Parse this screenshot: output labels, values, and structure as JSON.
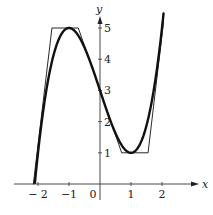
{
  "chart_data": {
    "type": "line",
    "title": "",
    "xlabel": "x",
    "ylabel": "y",
    "xlim": [
      -2.8,
      2.8
    ],
    "ylim": [
      -0.5,
      5.6
    ],
    "x_ticks": [
      -2,
      -1,
      0,
      1,
      2
    ],
    "x_tick_labels": [
      "− 2",
      "−1",
      "0",
      "1",
      "2"
    ],
    "y_ticks": [
      1,
      2,
      3,
      4,
      5
    ],
    "y_tick_labels": [
      "1",
      "2",
      "3",
      "4",
      "5"
    ],
    "grid": false,
    "legend": null,
    "series": [
      {
        "name": "f(x) = x^3 - 3x + 3",
        "style": "thick",
        "x": [
          -2.1,
          -2.0,
          -1.8,
          -1.6,
          -1.4,
          -1.2,
          -1.0,
          -0.8,
          -0.6,
          -0.4,
          -0.2,
          0.0,
          0.2,
          0.4,
          0.6,
          0.8,
          1.0,
          1.2,
          1.4,
          1.6,
          1.8,
          2.0,
          2.05
        ],
        "values": [
          0.04,
          1.0,
          2.57,
          3.7,
          4.46,
          4.87,
          5.0,
          4.89,
          4.58,
          4.14,
          3.59,
          3.0,
          2.41,
          1.86,
          1.42,
          1.11,
          1.0,
          1.13,
          1.54,
          2.3,
          3.43,
          5.0,
          5.47
        ]
      },
      {
        "name": "piecewise linear approximation",
        "style": "thin",
        "x": [
          -2.15,
          -1.55,
          -0.7,
          0.7,
          1.55,
          2.05
        ],
        "values": [
          0.0,
          5.0,
          5.0,
          1.0,
          1.0,
          5.2
        ]
      }
    ]
  }
}
